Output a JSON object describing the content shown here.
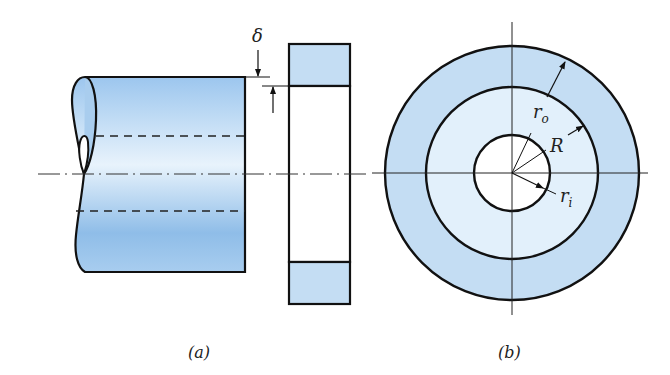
{
  "figure": {
    "panel_a": {
      "caption": "(a)",
      "shaft": {
        "fill_top": "#a9cdee",
        "fill_mid": "#e6f2fc",
        "fill_bottom": "#86b6e6"
      },
      "ring_section": {
        "fill": "#c4ddf3"
      },
      "interference_label": "δ"
    },
    "panel_b": {
      "caption": "(b)",
      "outer_ring_fill": "#c4ddf3",
      "inner_disc_fill": "#e2f0fb",
      "labels": {
        "outer_radius": "r",
        "outer_sub": "o",
        "interface_radius": "R",
        "inner_radius": "r",
        "inner_sub": "i"
      }
    },
    "stroke_color": "#111111"
  }
}
